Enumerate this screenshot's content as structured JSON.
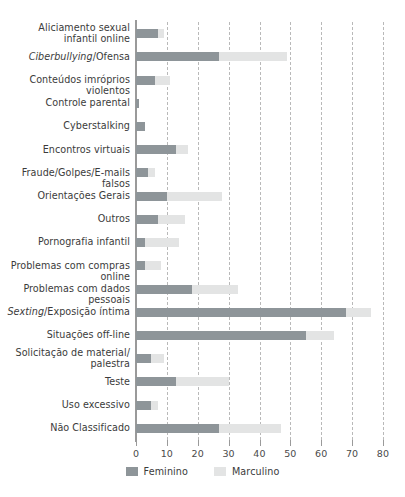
{
  "chart_data": {
    "type": "bar",
    "orientation": "horizontal",
    "title": "",
    "subtitle": "",
    "xlabel": "",
    "ylabel": "",
    "xlim": [
      0,
      80
    ],
    "xticks": [
      0,
      10,
      20,
      30,
      40,
      50,
      60,
      70,
      80
    ],
    "grid": "vertical-dashed",
    "legend_position": "bottom-center",
    "colors": {
      "Feminino": "#8e9599",
      "Marculino": "#e3e4e4"
    },
    "categories": [
      "Aliciamento sexual infantil online",
      "Ciberbullying/Ofensa",
      "Conteúdos imróprios violentos",
      "Controle parental",
      "Cyberstalking",
      "Encontros virtuais",
      "Fraude/Golpes/E-mails falsos",
      "Orientações Gerais",
      "Outros",
      "Pornografia infantil",
      "Problemas com compras online",
      "Problemas com dados pessoais",
      "Sexting/Exposição íntima",
      "Situações off-line",
      "Solicitação de material/ palestra",
      "Teste",
      "Uso excessivo",
      "Não Classificado"
    ],
    "series": [
      {
        "name": "Feminino",
        "values": [
          7,
          27,
          6,
          1,
          3,
          13,
          4,
          10,
          7,
          3,
          3,
          18,
          68,
          55,
          5,
          13,
          5,
          27
        ]
      },
      {
        "name": "Marculino",
        "values": [
          9,
          49,
          11,
          1,
          3,
          17,
          6,
          28,
          16,
          14,
          8,
          33,
          76,
          64,
          9,
          30,
          7,
          47
        ]
      }
    ]
  },
  "labels": [
    {
      "lines": [
        {
          "text": "Aliciamento sexual",
          "italic": false
        },
        {
          "text": "infantil online",
          "italic": false
        }
      ]
    },
    {
      "lines": [
        {
          "text": "Ciberbullying",
          "italic": true
        },
        {
          "text": "/Ofensa",
          "italic": false
        }
      ],
      "inline": true
    },
    {
      "lines": [
        {
          "text": "Conteúdos imróprios violentos",
          "italic": false
        }
      ]
    },
    {
      "lines": [
        {
          "text": "Controle parental",
          "italic": false
        }
      ]
    },
    {
      "lines": [
        {
          "text": "Cyberstalking",
          "italic": false
        }
      ]
    },
    {
      "lines": [
        {
          "text": "Encontros virtuais",
          "italic": false
        }
      ]
    },
    {
      "lines": [
        {
          "text": "Fraude/Golpes/E-mails falsos",
          "italic": false
        }
      ]
    },
    {
      "lines": [
        {
          "text": "Orientações Gerais",
          "italic": false
        }
      ]
    },
    {
      "lines": [
        {
          "text": "Outros",
          "italic": false
        }
      ]
    },
    {
      "lines": [
        {
          "text": "Pornografia infantil",
          "italic": false
        }
      ]
    },
    {
      "lines": [
        {
          "text": "Problemas com compras online",
          "italic": false
        }
      ]
    },
    {
      "lines": [
        {
          "text": "Problemas com dados pessoais",
          "italic": false
        }
      ]
    },
    {
      "lines": [
        {
          "text": "Sexting",
          "italic": true
        },
        {
          "text": "/Exposição íntima",
          "italic": false
        }
      ],
      "inline": true
    },
    {
      "lines": [
        {
          "text": "Situações off-line",
          "italic": false
        }
      ]
    },
    {
      "lines": [
        {
          "text": "Solicitação de material/",
          "italic": false
        },
        {
          "text": "palestra",
          "italic": false
        }
      ]
    },
    {
      "lines": [
        {
          "text": "Teste",
          "italic": false
        }
      ]
    },
    {
      "lines": [
        {
          "text": "Uso excessivo",
          "italic": false
        }
      ]
    },
    {
      "lines": [
        {
          "text": "Não Classificado",
          "italic": false
        }
      ]
    }
  ],
  "legend": {
    "items": [
      {
        "label": "Feminino",
        "color": "#8e9599"
      },
      {
        "label": "Marculino",
        "color": "#e3e4e4"
      }
    ]
  }
}
